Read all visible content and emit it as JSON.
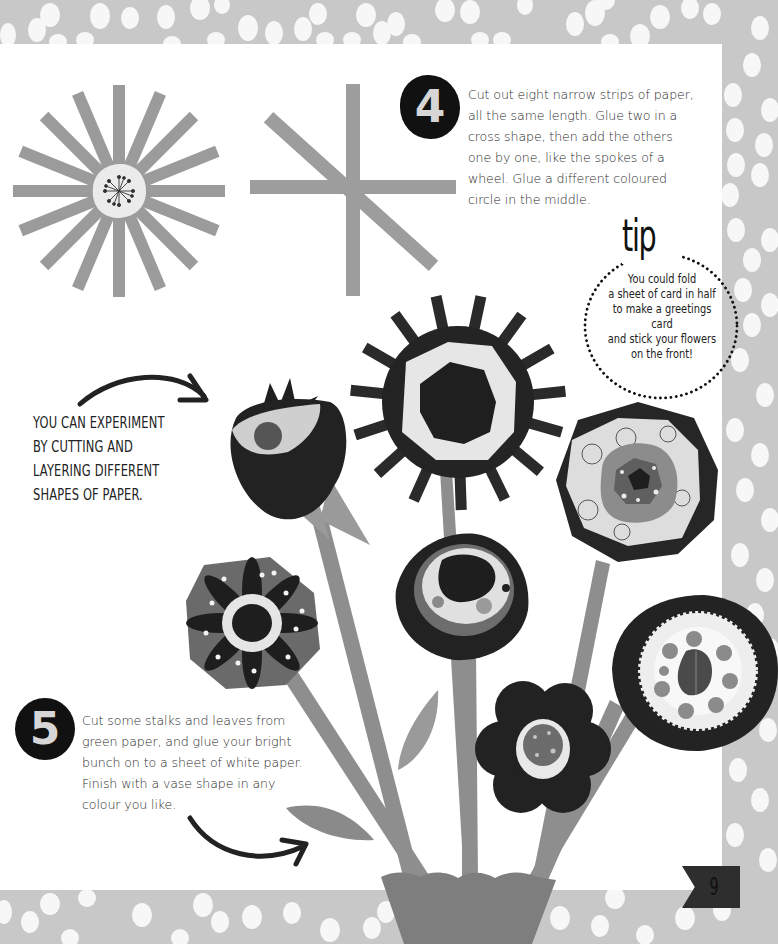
{
  "page": {
    "number": "9",
    "background_color": "#c9c9c9",
    "paper_color": "#ffffff"
  },
  "steps": [
    {
      "number": "4",
      "text": "Cut out eight narrow strips of paper, all the same length. Glue two in a cross shape, then add the others one by one, like the spokes of a wheel. Glue a different coloured circle in the middle.",
      "lines": [
        "Cut out eight narrow strips of paper,",
        "all the same length. Glue two in a",
        "cross shape, then add the others",
        "one by one, like the spokes of a",
        "wheel. Glue a different coloured",
        "circle in the middle."
      ]
    },
    {
      "number": "5",
      "text": "Cut some stalks and leaves from green paper, and glue your bright bunch on to a sheet of white paper. Finish with a vase shape in any colour you like.",
      "lines": [
        "Cut some stalks and leaves from",
        "green paper, and glue your bright",
        "bunch on to a sheet of white paper.",
        "Finish with a vase shape in any",
        "colour you like."
      ]
    }
  ],
  "tip": {
    "title": "tip",
    "lines": [
      "You could fold",
      "a sheet of card in half",
      "to make a greetings card",
      "and stick your flowers",
      "on the front!"
    ]
  },
  "note": {
    "lines": [
      "YOU CAN EXPERIMENT",
      "BY CUTTING AND",
      "LAYERING DIFFERENT",
      "SHAPES OF PAPER."
    ]
  },
  "illustrations": {
    "sun_wheel": "paper-strip-wheel-with-center-circle",
    "cross_strips": "two-crossed-strips-plus-diagonal",
    "bouquet": "paper-flower-bouquet-in-vase"
  },
  "colors": {
    "strip": "#9a9a9a",
    "dark": "#1e1e1e",
    "mid": "#6e6e6e",
    "light": "#e3e3e3",
    "stem": "#8c8c8c",
    "vase": "#7d7d7d"
  }
}
